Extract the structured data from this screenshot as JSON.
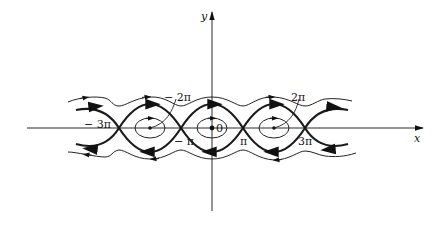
{
  "figure": {
    "type": "phase-portrait",
    "axes": {
      "x_label": "x",
      "y_label": "y"
    },
    "labels": {
      "neg_3pi": "− 3π",
      "neg_2pi": "− 2π",
      "neg_pi": "− π",
      "zero": "0",
      "pi": "π",
      "two_pi": "2π",
      "three_pi": "3π"
    },
    "centers": [
      "-2π",
      "0",
      "2π"
    ],
    "saddles": [
      "-3π",
      "-π",
      "π",
      "3π"
    ],
    "colors": {
      "ink": "#1a1a1a",
      "background": "#ffffff"
    }
  }
}
